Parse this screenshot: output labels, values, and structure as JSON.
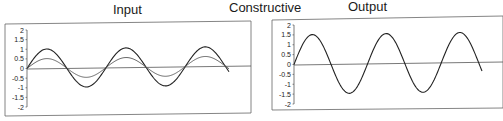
{
  "figure": {
    "center_label": "Constructive"
  },
  "chart_data": [
    {
      "type": "line",
      "title": "Input",
      "xlabel": "",
      "ylabel": "",
      "ylim": [
        -2,
        2
      ],
      "yticks": [
        "2",
        "1.5",
        "1",
        "0.5",
        "0",
        "-0.5",
        "-1",
        "-1.5",
        "-2"
      ],
      "grid": false,
      "legend": null,
      "cycles": 2.55,
      "series": [
        {
          "name": "wave A",
          "amplitude": 1.0,
          "phase": 0,
          "style": "solid"
        },
        {
          "name": "wave B",
          "amplitude": 0.5,
          "phase": 0,
          "style": "solid-light"
        }
      ]
    },
    {
      "type": "line",
      "title": "Output",
      "xlabel": "",
      "ylabel": "",
      "ylim": [
        -2,
        2
      ],
      "yticks": [
        "2",
        "1.5",
        "1",
        "0.5",
        "0",
        "-0.5",
        "-1",
        "-1.5",
        "-2"
      ],
      "grid": false,
      "legend": null,
      "cycles": 2.55,
      "series": [
        {
          "name": "sum",
          "amplitude": 1.5,
          "phase": 0,
          "style": "solid"
        }
      ]
    }
  ]
}
